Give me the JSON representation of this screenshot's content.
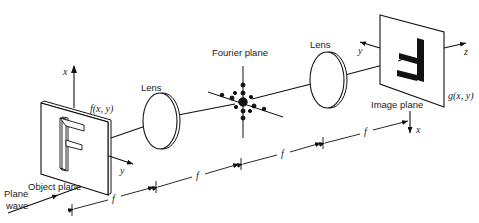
{
  "labels": {
    "plane_wave_line1": "Plane",
    "plane_wave_line2": "wave",
    "object_plane": "Object plane",
    "object_function": "f(x, y)",
    "lens_1": "Lens",
    "fourier_plane": "Fourier plane",
    "lens_2": "Lens",
    "image_plane": "Image plane",
    "image_function": "g(x, y)",
    "focal_length": "f"
  },
  "axes": {
    "object_x": "x",
    "object_y": "y",
    "image_x": "x",
    "image_y": "y",
    "image_z": "z"
  },
  "dimensions": {
    "segments": [
      "f",
      "f",
      "f",
      "f"
    ]
  },
  "colors": {
    "ink": "#111111",
    "background": "#ffffff"
  }
}
